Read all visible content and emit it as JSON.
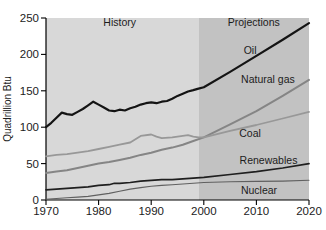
{
  "figure": {
    "y_axis_title": "Quadrillion Btu"
  },
  "chart_data": {
    "type": "line",
    "title": "",
    "xlabel": "",
    "ylabel": "Quadrillion Btu",
    "xlim": [
      1970,
      2020
    ],
    "ylim": [
      0,
      250
    ],
    "xticks": [
      1970,
      1980,
      1990,
      2000,
      2010,
      2020
    ],
    "yticks": [
      0,
      50,
      100,
      150,
      200,
      250
    ],
    "grid": false,
    "legend_position": "inline-labels",
    "axis_color": "#000000",
    "regions": [
      {
        "label": "History",
        "from": 1970,
        "to": 1999,
        "color": "#d8d8d8",
        "label_anchor": {
          "year": 1984.0,
          "value": 239
        }
      },
      {
        "label": "Projections",
        "from": 1999,
        "to": 2020,
        "color": "#c2c2c2",
        "label_anchor": {
          "year": 2009.5,
          "value": 239
        }
      }
    ],
    "series": [
      {
        "name": "Oil",
        "color": "#141414",
        "width": 2.2,
        "label_anchor": {
          "year": 2008.8,
          "value": 200
        },
        "x": [
          1970,
          1971,
          1972,
          1973,
          1974,
          1975,
          1976,
          1977,
          1978,
          1979,
          1980,
          1981,
          1982,
          1983,
          1984,
          1985,
          1986,
          1987,
          1988,
          1989,
          1990,
          1991,
          1992,
          1993,
          1994,
          1995,
          1996,
          1997,
          1998,
          1999,
          2000,
          2005,
          2010,
          2015,
          2020
        ],
        "y": [
          100,
          106,
          113,
          120,
          118,
          117,
          121,
          125,
          130,
          135,
          131,
          127,
          123,
          122,
          124,
          123,
          126,
          128,
          131,
          133,
          134,
          133,
          135,
          136,
          139,
          143,
          146,
          149,
          151,
          153,
          155,
          176,
          198,
          220,
          243
        ]
      },
      {
        "name": "Natural gas",
        "color": "#858585",
        "width": 2.0,
        "label_anchor": {
          "year": 2012.2,
          "value": 161
        },
        "x": [
          1970,
          1972,
          1974,
          1976,
          1978,
          1980,
          1982,
          1984,
          1986,
          1988,
          1990,
          1992,
          1994,
          1996,
          1998,
          2000,
          2005,
          2010,
          2015,
          2020
        ],
        "y": [
          37,
          39,
          41,
          44,
          47,
          50,
          52,
          55,
          58,
          62,
          65,
          69,
          72,
          76,
          81,
          86,
          104,
          122,
          143,
          165
        ]
      },
      {
        "name": "Coal",
        "color": "#989898",
        "width": 1.8,
        "label_anchor": {
          "year": 2008.8,
          "value": 86.5
        },
        "x": [
          1970,
          1972,
          1974,
          1976,
          1978,
          1980,
          1982,
          1984,
          1986,
          1988,
          1990,
          1991,
          1992,
          1994,
          1996,
          1997,
          1998,
          1999,
          2000,
          2005,
          2010,
          2015,
          2020
        ],
        "y": [
          60,
          62,
          63,
          65,
          67,
          70,
          73,
          76,
          79,
          88,
          90,
          87,
          85,
          86,
          88,
          89,
          87,
          86,
          86,
          95,
          103,
          112,
          121
        ]
      },
      {
        "name": "Renewables",
        "color": "#1f1f1f",
        "width": 1.7,
        "label_anchor": {
          "year": 2012.3,
          "value": 49.5
        },
        "x": [
          1970,
          1972,
          1974,
          1976,
          1978,
          1980,
          1982,
          1983,
          1984,
          1986,
          1988,
          1990,
          1992,
          1994,
          1996,
          1998,
          2000,
          2005,
          2010,
          2015,
          2020
        ],
        "y": [
          14,
          15,
          16,
          17,
          18,
          20,
          21,
          23,
          23,
          24,
          26,
          27,
          28,
          28,
          29,
          30,
          31,
          35,
          39,
          44,
          50
        ]
      },
      {
        "name": "Nuclear",
        "color": "#606060",
        "width": 1.1,
        "label_anchor": {
          "year": 2010.5,
          "value": 8
        },
        "x": [
          1970,
          1972,
          1974,
          1976,
          1978,
          1980,
          1982,
          1984,
          1986,
          1988,
          1990,
          1992,
          1994,
          1996,
          1998,
          2000,
          2005,
          2010,
          2015,
          2020
        ],
        "y": [
          1,
          2,
          3,
          4,
          5,
          7,
          9,
          12,
          15,
          17,
          19,
          20,
          21,
          22,
          23,
          24,
          25,
          25.5,
          26,
          27
        ]
      }
    ]
  }
}
